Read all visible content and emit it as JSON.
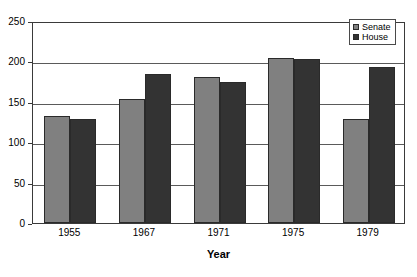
{
  "chart_data": {
    "type": "bar",
    "title": "",
    "xlabel": "Year",
    "ylabel": "",
    "categories": [
      "1955",
      "1967",
      "1971",
      "1975",
      "1979"
    ],
    "series": [
      {
        "name": "Senate",
        "color": "#808080",
        "values": [
          133,
          154,
          181,
          204,
          129
        ]
      },
      {
        "name": "House",
        "color": "#333333",
        "values": [
          129,
          185,
          174,
          203,
          193
        ]
      }
    ],
    "ylim": [
      0,
      250
    ],
    "yticks": [
      0,
      50,
      100,
      150,
      200,
      250
    ],
    "ytick_labels": [
      "0",
      "50",
      "100",
      "150",
      "200",
      "250"
    ],
    "grid": true,
    "legend_position": "top-right"
  },
  "legend": {
    "entries": [
      {
        "label": "Senate",
        "swatch": "#808080"
      },
      {
        "label": "House",
        "swatch": "#333333"
      }
    ]
  },
  "axis": {
    "x_title": "Year"
  }
}
